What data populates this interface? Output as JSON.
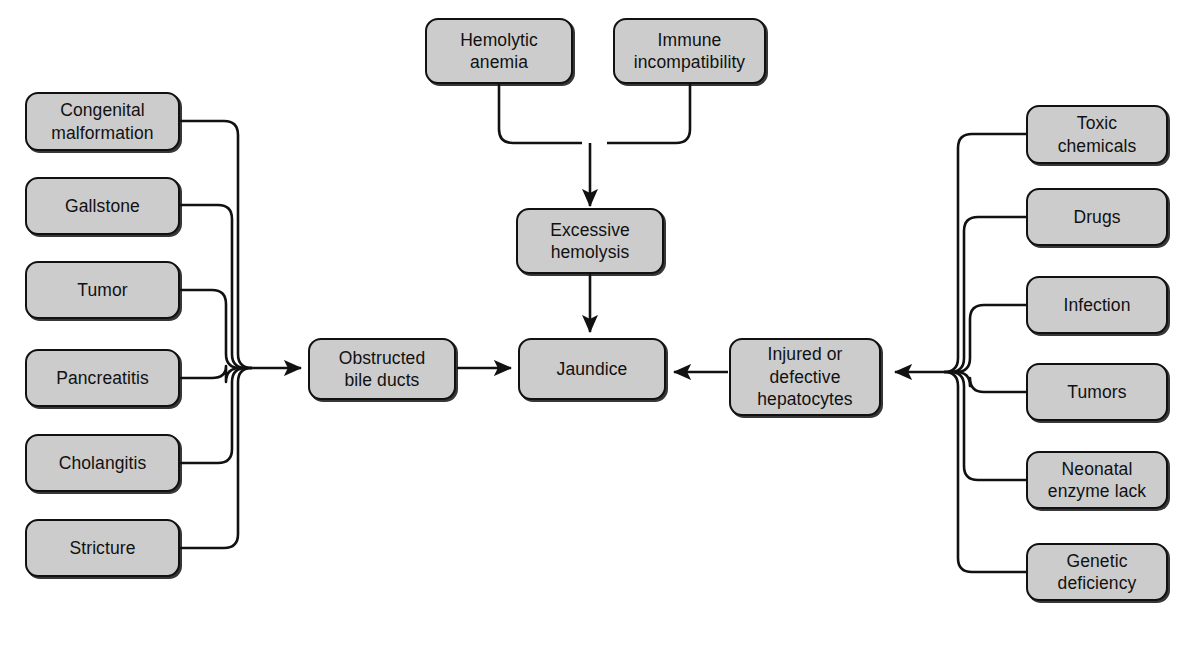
{
  "diagram": {
    "box_fill": "#cccccc",
    "box_stroke": "#111111",
    "background": "#ffffff",
    "nodes": {
      "hemolytic_anemia": {
        "label": "Hemolytic\nanemia"
      },
      "immune_incompatibility": {
        "label": "Immune\nincompatibility"
      },
      "excessive_hemolysis": {
        "label": "Excessive\nhemolysis"
      },
      "jaundice": {
        "label": "Jaundice"
      },
      "obstructed_bile_ducts": {
        "label": "Obstructed\nbile ducts"
      },
      "injured_hepatocytes": {
        "label": "Injured or\ndefective\nhepatocytes"
      },
      "congenital_malformation": {
        "label": "Congenital\nmalformation"
      },
      "gallstone": {
        "label": "Gallstone"
      },
      "tumor": {
        "label": "Tumor"
      },
      "pancreatitis": {
        "label": "Pancreatitis"
      },
      "cholangitis": {
        "label": "Cholangitis"
      },
      "stricture": {
        "label": "Stricture"
      },
      "toxic_chemicals": {
        "label": "Toxic\nchemicals"
      },
      "drugs": {
        "label": "Drugs"
      },
      "infection": {
        "label": "Infection"
      },
      "tumors": {
        "label": "Tumors"
      },
      "neonatal_enzyme_lack": {
        "label": "Neonatal\nenzyme lack"
      },
      "genetic_deficiency": {
        "label": "Genetic\ndeficiency"
      }
    },
    "groups": {
      "obstruction_causes": [
        "Congenital malformation",
        "Gallstone",
        "Tumor",
        "Pancreatitis",
        "Cholangitis",
        "Stricture"
      ],
      "hepatocyte_causes": [
        "Toxic chemicals",
        "Drugs",
        "Infection",
        "Tumors",
        "Neonatal enzyme lack",
        "Genetic deficiency"
      ],
      "hemolysis_causes": [
        "Hemolytic anemia",
        "Immune incompatibility"
      ]
    },
    "edges": [
      {
        "from": "Hemolytic anemia",
        "to": "Excessive hemolysis",
        "arrow": true
      },
      {
        "from": "Immune incompatibility",
        "to": "Excessive hemolysis",
        "arrow": true
      },
      {
        "from": "Excessive hemolysis",
        "to": "Jaundice",
        "arrow": true
      },
      {
        "from": "Congenital malformation",
        "to": "Obstructed bile ducts",
        "arrow": true
      },
      {
        "from": "Gallstone",
        "to": "Obstructed bile ducts",
        "arrow": true
      },
      {
        "from": "Tumor",
        "to": "Obstructed bile ducts",
        "arrow": true
      },
      {
        "from": "Pancreatitis",
        "to": "Obstructed bile ducts",
        "arrow": true
      },
      {
        "from": "Cholangitis",
        "to": "Obstructed bile ducts",
        "arrow": true
      },
      {
        "from": "Stricture",
        "to": "Obstructed bile ducts",
        "arrow": true
      },
      {
        "from": "Obstructed bile ducts",
        "to": "Jaundice",
        "arrow": true
      },
      {
        "from": "Toxic chemicals",
        "to": "Injured or defective hepatocytes",
        "arrow": true
      },
      {
        "from": "Drugs",
        "to": "Injured or defective hepatocytes",
        "arrow": true
      },
      {
        "from": "Infection",
        "to": "Injured or defective hepatocytes",
        "arrow": true
      },
      {
        "from": "Tumors",
        "to": "Injured or defective hepatocytes",
        "arrow": true
      },
      {
        "from": "Neonatal enzyme lack",
        "to": "Injured or defective hepatocytes",
        "arrow": true
      },
      {
        "from": "Genetic deficiency",
        "to": "Injured or defective hepatocytes",
        "arrow": true
      },
      {
        "from": "Injured or defective hepatocytes",
        "to": "Jaundice",
        "arrow": true
      }
    ]
  }
}
